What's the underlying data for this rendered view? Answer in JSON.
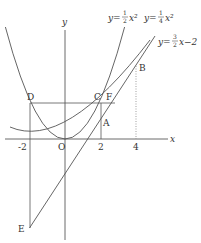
{
  "axes": {
    "x_label": "x",
    "y_label": "y",
    "origin_label": "O"
  },
  "ticks": {
    "x": [
      "-2",
      "2",
      "4"
    ]
  },
  "curves": [
    {
      "name": "parabola-half",
      "equation": "y = 1/2 x^2",
      "coef_num": "1",
      "coef_den": "2"
    },
    {
      "name": "parabola-quarter",
      "equation": "y = 1/4 x^2",
      "coef_num": "1",
      "coef_den": "4"
    },
    {
      "name": "line",
      "equation": "y = 3/2 x - 2",
      "coef_num": "3",
      "coef_den": "2",
      "const": "2"
    }
  ],
  "points": [
    {
      "label": "A",
      "x": 2,
      "y": 1
    },
    {
      "label": "B",
      "x": 4,
      "y": 4
    },
    {
      "label": "C",
      "x": 2,
      "y": 2
    },
    {
      "label": "D",
      "x": -2,
      "y": 2
    },
    {
      "label": "E",
      "x": -2,
      "y": -5
    },
    {
      "label": "F",
      "x": 2.83,
      "y": 2
    }
  ]
}
